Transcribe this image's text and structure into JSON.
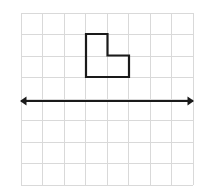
{
  "figure": {
    "title": "Geometry figure: L-shaped polygon above a horizontal line of reflection",
    "background_color": "#ffffff",
    "canvas": {
      "width": 215,
      "height": 195
    }
  },
  "grid": {
    "name": "coordinate-grid",
    "columns": 8,
    "rows": 8,
    "cell_size": 21.5,
    "origin_x": 21,
    "origin_y": 13,
    "width": 172,
    "height": 172,
    "line_color": "#d9d9d9",
    "line_width": 1
  },
  "axis_line": {
    "name": "line-of-reflection",
    "color": "#1a1a1a",
    "line_width": 1.4,
    "y": 101,
    "x_start": 21,
    "x_end": 193,
    "arrow_left": true,
    "arrow_right": true,
    "arrow_size": 4.5
  },
  "shape": {
    "name": "l-shaped-polygon",
    "stroke_color": "#1a1a1a",
    "stroke_width": 2.2,
    "fill": "none",
    "points": "86,34 107.5,34 107.5,55.5 129,55.5 129,77 86,77",
    "vertices": [
      {
        "x": 86,
        "y": 34
      },
      {
        "x": 107.5,
        "y": 34
      },
      {
        "x": 107.5,
        "y": 55.5
      },
      {
        "x": 129,
        "y": 55.5
      },
      {
        "x": 129,
        "y": 77
      },
      {
        "x": 86,
        "y": 77
      }
    ]
  },
  "chart_data": {
    "type": "scatter",
    "title": "",
    "xlabel": "",
    "ylabel": "",
    "grid": true,
    "legend": null,
    "grid_units": {
      "columns": 8,
      "rows": 8
    },
    "shape_in_grid_units": {
      "name": "L-shape",
      "vertices": [
        [
          3,
          1
        ],
        [
          4,
          1
        ],
        [
          4,
          2
        ],
        [
          5,
          2
        ],
        [
          5,
          3
        ],
        [
          3,
          3
        ]
      ],
      "area_square_units": 3
    },
    "reflection_line_in_grid_units": {
      "orientation": "horizontal",
      "row_from_top": 4,
      "x_from": 0,
      "x_to": 8
    }
  }
}
